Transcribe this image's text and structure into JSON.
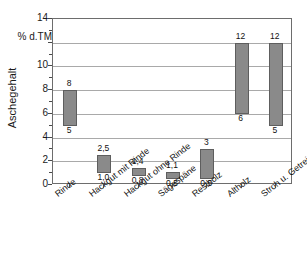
{
  "chart_data": {
    "type": "bar",
    "title": "",
    "subtitle": "",
    "xlabel": "",
    "ylabel": "Aschegehalt",
    "unit_label": "% d.TM",
    "ylim": [
      0,
      14
    ],
    "ytick_step": 2,
    "minor_tick_step": 1,
    "grid": true,
    "legend": "none",
    "bar_color": "#8a8a8a",
    "bar_edge_color": "#5e5e5e",
    "note": "Floating range bars: each bar spans from its minimum to its maximum value; labels show min below and max above the bar.",
    "categories": [
      "Rinde",
      "Hackgut mit Rinde",
      "Hackgut ohne Rinde",
      "Sägespäne",
      "Restholz",
      "Altholz",
      "Stroh u. Getreide-GP"
    ],
    "ytick_labels": [
      "0",
      "2",
      "4",
      "6",
      "8",
      "10",
      "% d.TM",
      "14"
    ],
    "ytick_values": [
      0,
      2,
      4,
      6,
      8,
      10,
      12,
      14
    ],
    "series": [
      {
        "name": "Aschegehalt-Bereich",
        "low": [
          5,
          1.0,
          0.8,
          0.5,
          0.5,
          6,
          5
        ],
        "high": [
          8,
          2.5,
          1.4,
          1.1,
          3,
          12,
          12
        ],
        "low_labels": [
          "5",
          "1,0",
          "0,8",
          "0,5",
          "0,5",
          "6",
          "5"
        ],
        "high_labels": [
          "8",
          "2,5",
          "1,4",
          "1,1",
          "3",
          "12",
          "12"
        ]
      }
    ]
  },
  "bars": [
    {
      "category": "Rinde",
      "low": 5,
      "high": 8,
      "low_label": "5",
      "high_label": "8"
    },
    {
      "category": "Hackgut mit Rinde",
      "low": 1.0,
      "high": 2.5,
      "low_label": "1,0",
      "high_label": "2,5"
    },
    {
      "category": "Hackgut ohne Rinde",
      "low": 0.8,
      "high": 1.4,
      "low_label": "0,8",
      "high_label": "1,4"
    },
    {
      "category": "Sägespäne",
      "low": 0.5,
      "high": 1.1,
      "low_label": "0,5",
      "high_label": "1,1"
    },
    {
      "category": "Restholz",
      "low": 0.5,
      "high": 3,
      "low_label": "0,5",
      "high_label": "3"
    },
    {
      "category": "Altholz",
      "low": 6,
      "high": 12,
      "low_label": "6",
      "high_label": "12"
    },
    {
      "category": "Stroh u. Getreide-GP",
      "low": 5,
      "high": 12,
      "low_label": "5",
      "high_label": "12"
    }
  ]
}
